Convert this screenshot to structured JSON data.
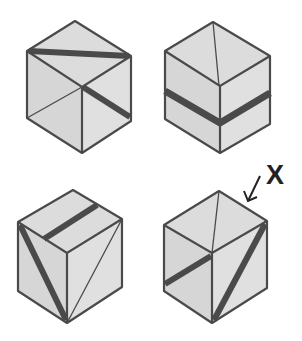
{
  "diagram": {
    "title": "",
    "colors": {
      "face": "#dcdcdc",
      "edge": "#4a4a4a",
      "stripe": "#4a4a4a",
      "background": "#ffffff"
    },
    "marker": {
      "label": "X",
      "points_to": "cube-4"
    },
    "cubes": [
      {
        "id": "cube-1",
        "position": "top-left",
        "description": "Thick stripe across top face edge-to-edge; thin diagonal on left face; thick diagonal stripe on right face"
      },
      {
        "id": "cube-2",
        "position": "top-right",
        "description": "Thin line on top face; thick horizontal band wrapping left and right faces"
      },
      {
        "id": "cube-3",
        "position": "bottom-left",
        "description": "Thick stripe on top face; thick diagonal on left face; thin diagonal on right face"
      },
      {
        "id": "cube-4",
        "position": "bottom-right",
        "description": "Thin line on top face; thick diagonal on left face; thick diagonal on right face; marked X"
      }
    ]
  }
}
